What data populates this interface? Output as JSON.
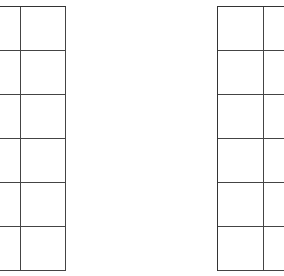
{
  "diagram": {
    "background": "#ffffff",
    "line_color": "#333333",
    "grids": [
      {
        "name": "left-grid",
        "x": -25,
        "y": 6,
        "cols": 2,
        "rows": 6,
        "col_widths": [
          45,
          45
        ],
        "row_height": 44
      },
      {
        "name": "right-grid",
        "x": 217,
        "y": 6,
        "cols": 2,
        "rows": 6,
        "col_widths": [
          46,
          46
        ],
        "row_height": 44
      }
    ]
  }
}
